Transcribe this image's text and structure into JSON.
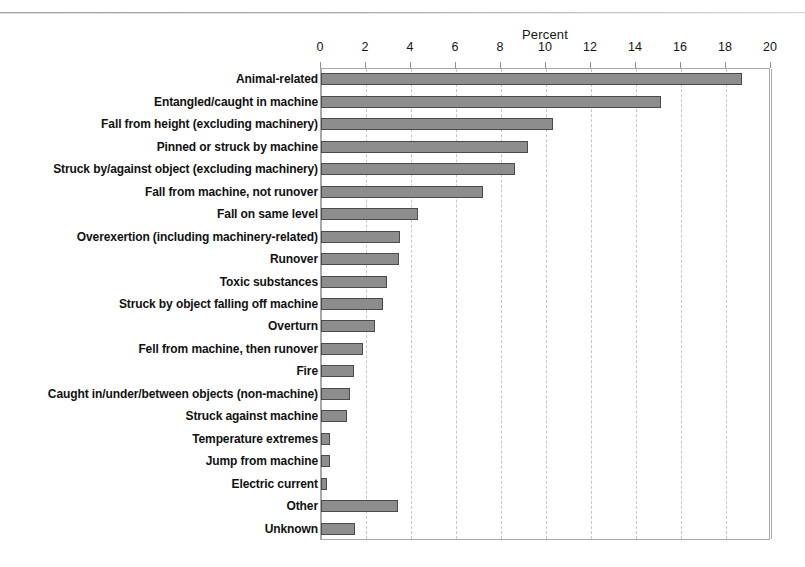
{
  "chart_data": {
    "type": "bar",
    "orientation": "horizontal",
    "title": "",
    "xlabel": "Percent",
    "ylabel": "",
    "xlim": [
      0,
      20
    ],
    "xticks": [
      0,
      2,
      4,
      6,
      8,
      10,
      12,
      14,
      16,
      18,
      20
    ],
    "grid": true,
    "grid_axis": "x",
    "legend": false,
    "bar_color": "#8d8d8d",
    "bar_edge_color": "#4a4a4a",
    "categories": [
      "Animal-related",
      "Entangled/caught in machine",
      "Fall from height (excluding machinery)",
      "Pinned or struck by machine",
      "Struck by/against object (excluding machinery)",
      "Fall from machine, not runover",
      "Fall on same level",
      "Overexertion (including machinery-related)",
      "Runover",
      "Toxic substances",
      "Struck by object falling off machine",
      "Overturn",
      "Fell from machine, then runover",
      "Fire",
      "Caught in/under/between objects (non-machine)",
      "Struck against machine",
      "Temperature extremes",
      "Jump from machine",
      "Electric current",
      "Other",
      "Unknown"
    ],
    "values": [
      18.7,
      15.1,
      10.3,
      9.2,
      8.6,
      7.2,
      4.3,
      3.5,
      3.45,
      2.95,
      2.75,
      2.4,
      1.85,
      1.45,
      1.3,
      1.15,
      0.4,
      0.4,
      0.25,
      3.4,
      1.5
    ]
  }
}
